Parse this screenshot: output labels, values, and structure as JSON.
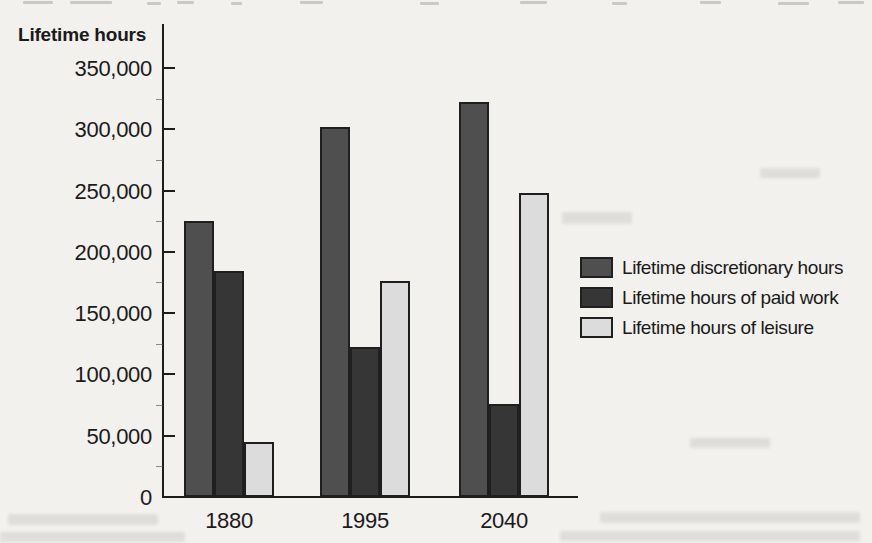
{
  "page": {
    "background_color": "#f2f1ee",
    "text_color": "#1a1a1a",
    "axis_color": "#1c1c1c"
  },
  "chart_data": {
    "type": "bar",
    "title": "",
    "y_axis_title": "Lifetime hours",
    "categories": [
      "1880",
      "1995",
      "2040"
    ],
    "series": [
      {
        "name": "Lifetime discretionary hours",
        "color": "#4f4f4f",
        "values": [
          225000,
          302000,
          322000
        ]
      },
      {
        "name": "Lifetime hours of paid work",
        "color": "#363636",
        "values": [
          184000,
          122000,
          76000
        ]
      },
      {
        "name": "Lifetime hours of leisure",
        "color": "#dcdcdc",
        "values": [
          45000,
          176000,
          248000
        ]
      }
    ],
    "ylim": [
      0,
      370000
    ],
    "yticks": [
      0,
      50000,
      100000,
      150000,
      200000,
      250000,
      300000,
      350000
    ],
    "ytick_labels": [
      "0",
      "50,000",
      "100,000",
      "150,000",
      "200,000",
      "250,000",
      "300,000",
      "350,000"
    ],
    "minor_tick_interval": 25000,
    "grid": false,
    "legend_position": "right",
    "bar_outline_color": "#1f1f1f"
  }
}
